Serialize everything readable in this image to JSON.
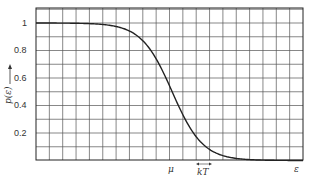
{
  "chart_data": {
    "type": "line",
    "title": "",
    "xlabel": "ε",
    "ylabel": "p(ε)",
    "ylim": [
      0,
      1.1
    ],
    "grid": true,
    "y_ticks": [
      "1",
      "0.8",
      "0.6",
      "0.4",
      "0.2"
    ],
    "x_annotations": [
      "μ",
      "kT"
    ],
    "series": [
      {
        "name": "p(ε) Fermi-Dirac distribution",
        "x_description": "ε in grid units, μ at column ~10.2 of 20",
        "x": [
          0,
          2,
          4,
          5,
          6,
          7,
          8,
          9,
          10,
          10.2,
          11,
          12,
          13,
          14,
          15,
          16,
          18,
          20
        ],
        "values": [
          1.0,
          1.0,
          1.0,
          0.999,
          0.995,
          0.98,
          0.94,
          0.83,
          0.55,
          0.5,
          0.33,
          0.15,
          0.06,
          0.02,
          0.005,
          0.0,
          0.0,
          0.0
        ]
      }
    ]
  },
  "labels": {
    "y_axis": "p(ε)",
    "x_axis": "ε",
    "mu": "μ",
    "kT": "kT",
    "y1": "1",
    "y08": "0.8",
    "y06": "0.6",
    "y04": "0.4",
    "y02": "0.2"
  }
}
